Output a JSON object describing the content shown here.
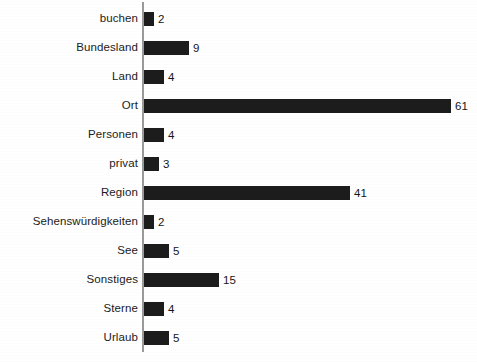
{
  "chart_data": {
    "type": "bar",
    "orientation": "horizontal",
    "title": "",
    "subtitle": "",
    "xlabel": "",
    "ylabel": "",
    "grid": false,
    "legend": null,
    "legend_position": "none",
    "axis_line_color": "#9a9a9a",
    "bar_color": "#1c1c1c",
    "background_color": "#ffffff",
    "xlim": [
      0,
      61
    ],
    "value_labels_shown": true,
    "px_per_unit": 5.03,
    "categories": [
      "buchen",
      "Bundesland",
      "Land",
      "Ort",
      "Personen",
      "privat",
      "Region",
      "Sehenswürdigkeiten",
      "See",
      "Sonstiges",
      "Sterne",
      "Urlaub"
    ],
    "values": [
      2,
      9,
      4,
      61,
      4,
      3,
      41,
      2,
      5,
      15,
      4,
      5
    ],
    "bars": [
      {
        "label": "buchen",
        "value": 2,
        "value_text": "2"
      },
      {
        "label": "Bundesland",
        "value": 9,
        "value_text": "9"
      },
      {
        "label": "Land",
        "value": 4,
        "value_text": "4"
      },
      {
        "label": "Ort",
        "value": 61,
        "value_text": "61"
      },
      {
        "label": "Personen",
        "value": 4,
        "value_text": "4"
      },
      {
        "label": "privat",
        "value": 3,
        "value_text": "3"
      },
      {
        "label": "Region",
        "value": 41,
        "value_text": "41"
      },
      {
        "label": "Sehenswürdigkeiten",
        "value": 2,
        "value_text": "2"
      },
      {
        "label": "See",
        "value": 5,
        "value_text": "5"
      },
      {
        "label": "Sonstiges",
        "value": 15,
        "value_text": "15"
      },
      {
        "label": "Sterne",
        "value": 4,
        "value_text": "4"
      },
      {
        "label": "Urlaub",
        "value": 5,
        "value_text": "5"
      }
    ]
  }
}
